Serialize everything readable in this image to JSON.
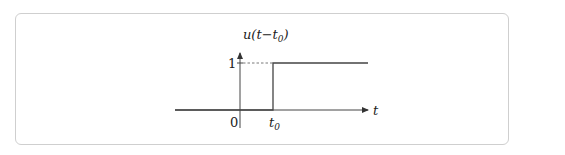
{
  "diagram": {
    "y_axis_label": "u(t−t",
    "y_axis_label_sub": "0",
    "y_axis_label_close": ")",
    "x_axis_label": "t",
    "tick_y_one": "1",
    "tick_x_zero": "0",
    "tick_x_t0": "t",
    "tick_x_t0_sub": "0",
    "colors": {
      "line": "#444444",
      "frame": "#cfcfcf",
      "dashed": "#555555"
    }
  }
}
